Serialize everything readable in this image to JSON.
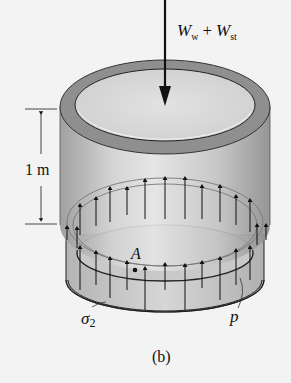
{
  "figure": {
    "caption": "(b)",
    "load_label": {
      "W1": "W",
      "sub1": "w",
      "plus": "+",
      "W2": "W",
      "sub2": "st"
    },
    "dimension_label": "1 m",
    "point_label": "A",
    "stress_label": {
      "sigma": "σ",
      "sub": "2"
    },
    "pressure_label": "p"
  },
  "colors": {
    "background": "#f3f3f3",
    "cylinder_body": "#bdbdbd",
    "rim": "#8f8f8f",
    "inner_top": "#d9d9d9",
    "ink": "#111111"
  }
}
